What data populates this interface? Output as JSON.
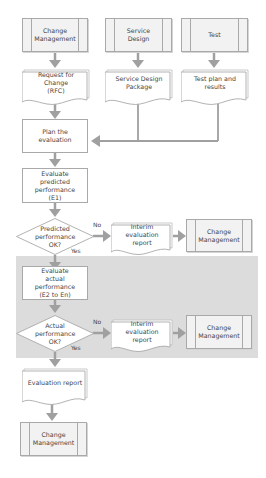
{
  "diagram": {
    "colors": {
      "connector": "#a0a0a0",
      "box_border": "#a9a9a9",
      "process_fill": "#f2f2f2",
      "band_fill": "#dcdcdc",
      "text": "#444444"
    },
    "inputs": [
      {
        "label": "Change Management"
      },
      {
        "label": "Service Design"
      },
      {
        "label": "Test"
      }
    ],
    "input_documents": [
      {
        "label": "Request for Change (RFC)"
      },
      {
        "label": "Service Design Package"
      },
      {
        "label": "Test plan and results"
      }
    ],
    "steps": {
      "plan": "Plan the evaluation",
      "evaluate_predicted": "Evaluate predicted performance (E1)",
      "decision_predicted": "Predicted performance OK?",
      "evaluate_actual": "Evaluate actual performance (E2 to En)",
      "decision_actual": "Actual performance OK?",
      "evaluation_report": "Evaluation report",
      "final_change_management": "Change Management"
    },
    "branches": {
      "predicted_no": {
        "no_label": "No",
        "yes_label": "Yes",
        "report": "Interim evaluation report",
        "target": "Change Management"
      },
      "actual_no": {
        "no_label": "No",
        "yes_label": "Yes",
        "report": "Interim evaluation report",
        "target": "Change Management"
      }
    }
  }
}
